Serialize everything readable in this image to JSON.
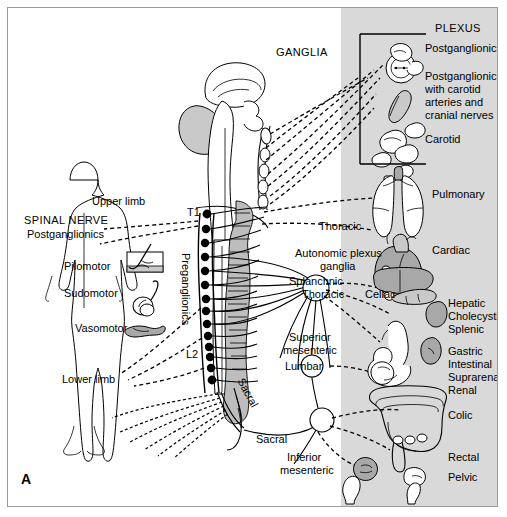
{
  "figure": {
    "panel_label": "A",
    "title_ganglia": "GANGLIA",
    "title_plexus": "PLEXUS"
  },
  "colors": {
    "panel_background": "#d9d9d9",
    "page_background": "#ffffff",
    "frame_border": "#9a9a9a",
    "organ_fill_gray": "#a8a8a8",
    "organ_fill_light": "#c9c9c9",
    "organ_fill_white": "#ffffff",
    "line_black": "#000000",
    "spinal_gray": "#bdbdbd"
  },
  "left_labels": {
    "spinal_nerve": "SPINAL NERVE",
    "postganglionics": "Postganglionics",
    "upper_limb": "Upper limb",
    "pilomotor": "Pilomotor",
    "sudomotor": "Sudomotor",
    "vasomotor": "Vasomotor",
    "lower_limb": "Lower limb"
  },
  "spine_labels": {
    "t1": "T1",
    "l2": "L2",
    "preganglionics": "Preganglionics",
    "sacral_rotated": "Sacral"
  },
  "center_labels": {
    "thoracic": "Thoracic",
    "autonomic_plexus_ganglia_line1": "Autonomic plexus",
    "autonomic_plexus_ganglia_line2": "ganglia",
    "splanchnic": "Splanchnic",
    "splanchnic_thoracic": "Thoracic",
    "celiac": "Celiac",
    "superior_mesenteric_line1": "Superior",
    "superior_mesenteric_line2": "mesenteric",
    "lumbar": "Lumbar",
    "sacral": "Sacral",
    "inferior_mesenteric_line1": "Inferior",
    "inferior_mesenteric_line2": "mesenteric"
  },
  "plexus_legend": {
    "heading": "PLEXUS",
    "items": [
      {
        "id": "postganglionics",
        "text": "Postganglionics"
      },
      {
        "id": "postganglionics-carotid",
        "lines": [
          "Postganglionics",
          "with carotid",
          "arteries and",
          "cranial nerves"
        ]
      },
      {
        "id": "carotid",
        "text": "Carotid"
      }
    ]
  },
  "right_labels": [
    {
      "id": "pulmonary",
      "text": "Pulmonary"
    },
    {
      "id": "cardiac",
      "text": "Cardiac"
    },
    {
      "id": "hepatic",
      "text": "Hepatic"
    },
    {
      "id": "cholecystic",
      "text": "Cholecystic"
    },
    {
      "id": "splenic",
      "text": "Splenic"
    },
    {
      "id": "gastric",
      "text": "Gastric"
    },
    {
      "id": "intestinal",
      "text": "Intestinal"
    },
    {
      "id": "suprarenal",
      "text": "Suprarenal"
    },
    {
      "id": "renal",
      "text": "Renal"
    },
    {
      "id": "colic",
      "text": "Colic"
    },
    {
      "id": "rectal",
      "text": "Rectal"
    },
    {
      "id": "pelvic",
      "text": "Pelvic"
    }
  ],
  "organs": [
    {
      "id": "eye",
      "name": "eyeball"
    },
    {
      "id": "lacrimal-gland",
      "name": "lacrimal gland"
    },
    {
      "id": "carotid-artery",
      "name": "carotid artery"
    },
    {
      "id": "salivary-glands",
      "name": "salivary glands"
    },
    {
      "id": "lungs",
      "name": "lungs"
    },
    {
      "id": "heart",
      "name": "heart"
    },
    {
      "id": "liver",
      "name": "liver"
    },
    {
      "id": "pancreas",
      "name": "pancreas"
    },
    {
      "id": "spleen",
      "name": "spleen"
    },
    {
      "id": "stomach",
      "name": "stomach"
    },
    {
      "id": "small-intestine",
      "name": "small intestine"
    },
    {
      "id": "kidney",
      "name": "kidney"
    },
    {
      "id": "colon",
      "name": "large intestine"
    },
    {
      "id": "bladder",
      "name": "bladder"
    },
    {
      "id": "genitals",
      "name": "pelvic organs"
    }
  ],
  "body_icons": [
    {
      "id": "hair-follicle",
      "name": "hair follicle / arrector pili"
    },
    {
      "id": "sweat-gland",
      "name": "sweat gland"
    },
    {
      "id": "blood-vessel",
      "name": "blood vessel"
    }
  ],
  "spinal_segments": {
    "count": 14,
    "top_label": "T1",
    "bottom_label": "L2"
  }
}
